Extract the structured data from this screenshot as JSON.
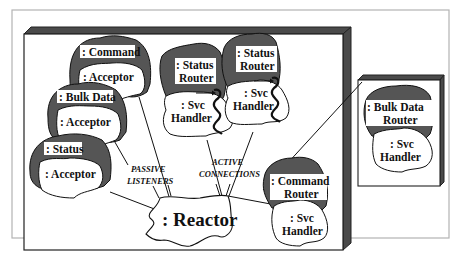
{
  "diagram": {
    "type": "object-collaboration",
    "colors": {
      "background": "#ffffff",
      "outer_frame": "#b0b0b0",
      "box_bevel": "#4a4a4a",
      "shaded_blob": "#555555",
      "white_blob": "#ffffff",
      "stroke": "#111111"
    },
    "acceptors": [
      {
        "top_label": ": Command",
        "bottom_label": ": Acceptor"
      },
      {
        "top_label": ": Bulk Data",
        "bottom_label": ": Acceptor"
      },
      {
        "top_label": ": Status",
        "bottom_label": ": Acceptor"
      }
    ],
    "status_routers": [
      {
        "top_line1": ": Status",
        "top_line2": "Router",
        "bottom_line1": ": Svc",
        "bottom_line2": "Handler"
      },
      {
        "top_line1": ": Status",
        "top_line2": "Router",
        "bottom_line1": ": Svc",
        "bottom_line2": "Handler"
      }
    ],
    "command_router": {
      "top_line1": ": Command",
      "top_line2": "Router",
      "bottom_line1": ": Svc",
      "bottom_line2": "Handler"
    },
    "bulk_data_router": {
      "top_line1": ": Bulk Data",
      "top_line2": "Router",
      "bottom_line1": ": Svc",
      "bottom_line2": "Handler"
    },
    "reactor": {
      "label": ": Reactor"
    },
    "annotations": {
      "passive_line1": "PASSIVE",
      "passive_line2": "LISTENERS",
      "active_line1": "ACTIVE",
      "active_line2": "CONNECTIONS"
    }
  }
}
